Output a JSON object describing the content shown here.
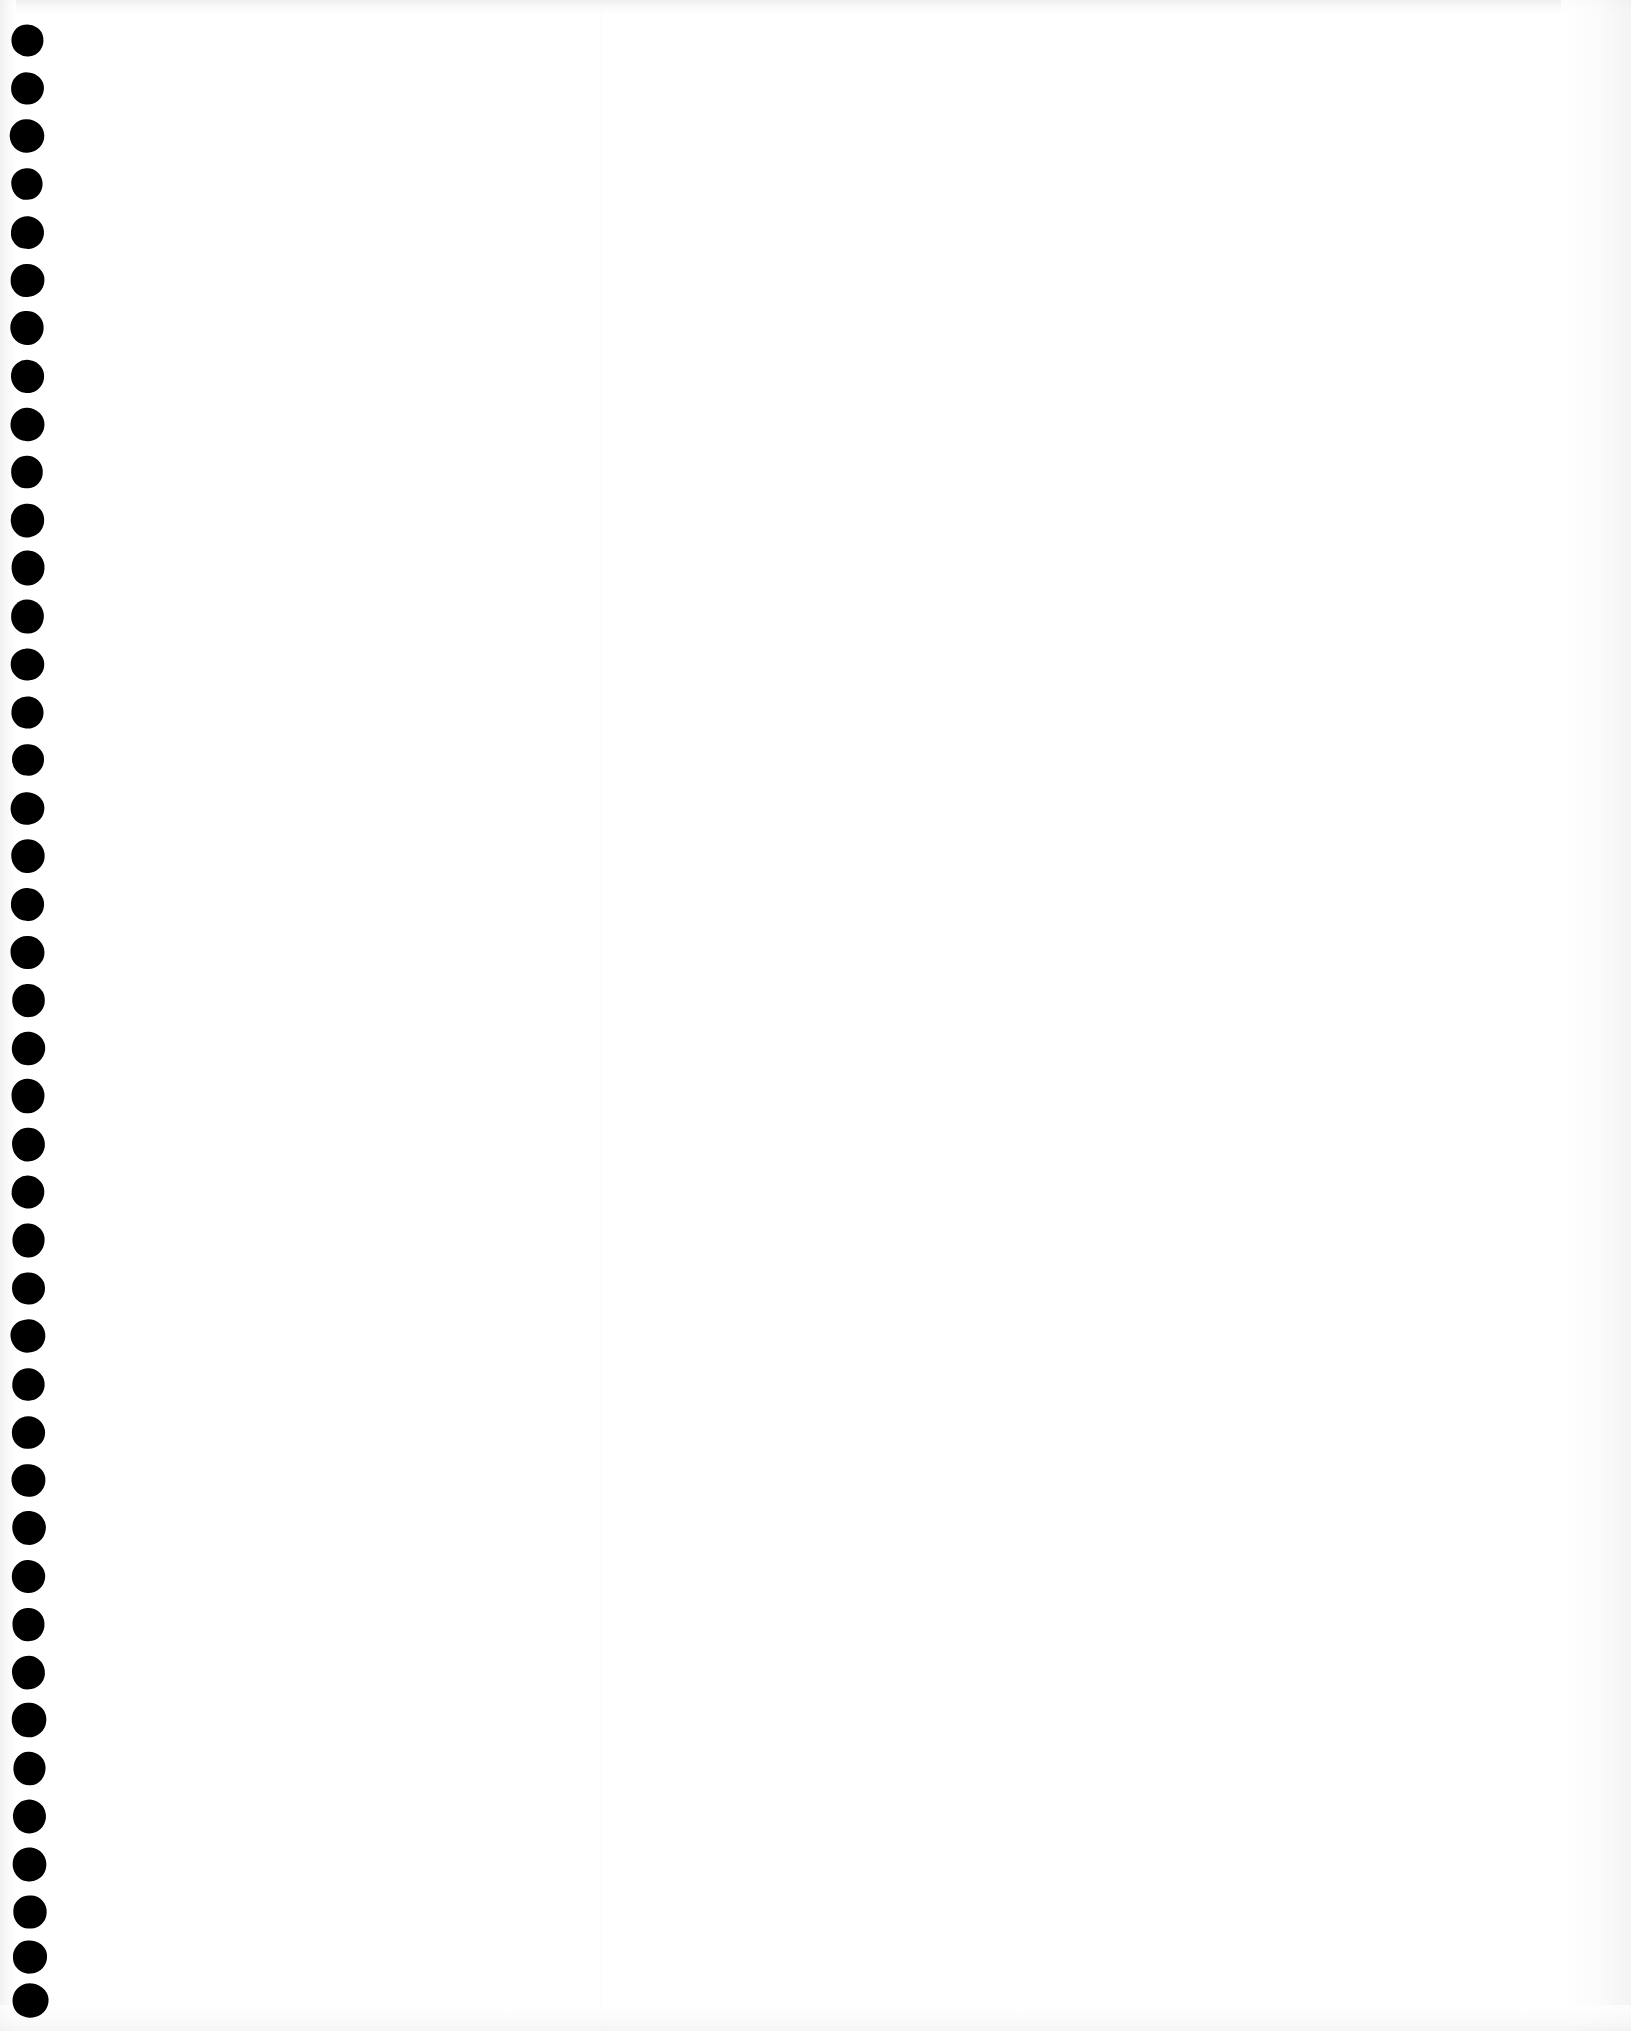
{
  "document": {
    "kind": "scanned-blank-page",
    "title": "Blank notebook page (scan)",
    "page_width": 1631,
    "page_height": 2031,
    "background_color": "#ffffff",
    "text_content": "",
    "visible_text_blocks": [],
    "notes": "No printed or handwritten content is visible anywhere on the sheet."
  },
  "paper": {
    "color": "#ffffff",
    "edge_shadow_color": "#f1f1f2",
    "top_edge_tone": "#ececed",
    "left_edge_tone": "#f0f0f1",
    "streak_x": 600
  },
  "binding": {
    "type": "spiral-punch-holes",
    "edge": "left",
    "hole_color": "#000000",
    "hole_count": 42,
    "hole_diameter": 33,
    "hole_pitch": 48,
    "first_center_y": 40,
    "first_center_x": 27,
    "last_center_y": 2000,
    "last_center_x": 30,
    "holes": [
      {
        "cx": 27.0,
        "cy": 40,
        "d": 33
      },
      {
        "cx": 27.1,
        "cy": 88,
        "d": 33
      },
      {
        "cx": 27.1,
        "cy": 136,
        "d": 34
      },
      {
        "cx": 26.9,
        "cy": 184,
        "d": 32
      },
      {
        "cx": 27.2,
        "cy": 232,
        "d": 33
      },
      {
        "cx": 27.2,
        "cy": 280,
        "d": 33
      },
      {
        "cx": 27.3,
        "cy": 328,
        "d": 34
      },
      {
        "cx": 27.3,
        "cy": 376,
        "d": 33
      },
      {
        "cx": 27.4,
        "cy": 424,
        "d": 33
      },
      {
        "cx": 27.4,
        "cy": 472,
        "d": 32
      },
      {
        "cx": 27.5,
        "cy": 520,
        "d": 33
      },
      {
        "cx": 27.5,
        "cy": 568,
        "d": 34
      },
      {
        "cx": 27.6,
        "cy": 616,
        "d": 33
      },
      {
        "cx": 27.6,
        "cy": 664,
        "d": 33
      },
      {
        "cx": 27.7,
        "cy": 712,
        "d": 33
      },
      {
        "cx": 27.7,
        "cy": 760,
        "d": 32
      },
      {
        "cx": 27.8,
        "cy": 808,
        "d": 33
      },
      {
        "cx": 27.8,
        "cy": 856,
        "d": 34
      },
      {
        "cx": 27.9,
        "cy": 904,
        "d": 33
      },
      {
        "cx": 27.9,
        "cy": 952,
        "d": 33
      },
      {
        "cx": 28.0,
        "cy": 1000,
        "d": 33
      },
      {
        "cx": 28.0,
        "cy": 1048,
        "d": 33
      },
      {
        "cx": 28.1,
        "cy": 1096,
        "d": 34
      },
      {
        "cx": 28.1,
        "cy": 1144,
        "d": 33
      },
      {
        "cx": 28.2,
        "cy": 1192,
        "d": 32
      },
      {
        "cx": 28.2,
        "cy": 1240,
        "d": 33
      },
      {
        "cx": 28.3,
        "cy": 1288,
        "d": 33
      },
      {
        "cx": 28.4,
        "cy": 1336,
        "d": 34
      },
      {
        "cx": 28.4,
        "cy": 1384,
        "d": 33
      },
      {
        "cx": 28.5,
        "cy": 1432,
        "d": 33
      },
      {
        "cx": 28.6,
        "cy": 1480,
        "d": 33
      },
      {
        "cx": 28.6,
        "cy": 1528,
        "d": 34
      },
      {
        "cx": 28.7,
        "cy": 1576,
        "d": 33
      },
      {
        "cx": 28.8,
        "cy": 1624,
        "d": 33
      },
      {
        "cx": 28.8,
        "cy": 1672,
        "d": 33
      },
      {
        "cx": 28.9,
        "cy": 1720,
        "d": 34
      },
      {
        "cx": 29.0,
        "cy": 1768,
        "d": 33
      },
      {
        "cx": 29.1,
        "cy": 1816,
        "d": 33
      },
      {
        "cx": 29.3,
        "cy": 1864,
        "d": 33
      },
      {
        "cx": 29.5,
        "cy": 1912,
        "d": 34
      },
      {
        "cx": 29.7,
        "cy": 1957,
        "d": 34
      },
      {
        "cx": 30.0,
        "cy": 2000,
        "d": 35
      }
    ]
  }
}
